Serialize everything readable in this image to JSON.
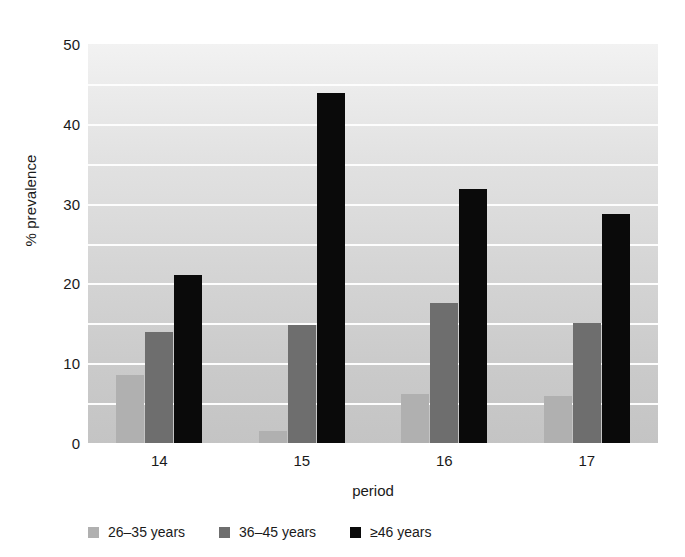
{
  "chart_data": {
    "type": "bar",
    "title": "",
    "subtitle": "",
    "xlabel": "period",
    "ylabel": "% prevalence",
    "categories": [
      "14",
      "15",
      "16",
      "17"
    ],
    "series": [
      {
        "name": "26–35 years",
        "color": "#b0b0b0",
        "values": [
          8.5,
          1.5,
          6.1,
          5.9
        ]
      },
      {
        "name": "36–45 years",
        "color": "#6e6e6e",
        "values": [
          13.9,
          14.8,
          17.6,
          15.0
        ]
      },
      {
        "name": "≥46 years",
        "color": "#0a0a0a",
        "values": [
          21.1,
          43.9,
          31.8,
          28.7
        ]
      }
    ],
    "ylim": [
      0,
      50
    ],
    "y_ticks": [
      0,
      10,
      20,
      30,
      40,
      50
    ],
    "y_tick_labels": [
      "0",
      "10",
      "20",
      "30",
      "40",
      "50"
    ],
    "gridlines": {
      "visible": true,
      "interval": 5,
      "color": "#fdfdfd"
    },
    "grid_values": [
      5,
      10,
      15,
      20,
      25,
      30,
      35,
      40,
      45
    ],
    "legend": {
      "position": "bottom-left",
      "entries": [
        {
          "label": "26–35 years",
          "color": "#b0b0b0"
        },
        {
          "label": "36–45 years",
          "color": "#6e6e6e"
        },
        {
          "label": "≥46 years",
          "color": "#0a0a0a"
        }
      ]
    },
    "plot_background": {
      "type": "vertical-gradient",
      "top_color": "#f2f2f2",
      "bottom_color": "#c4c4c4"
    },
    "figure_background": "#ffffff"
  }
}
